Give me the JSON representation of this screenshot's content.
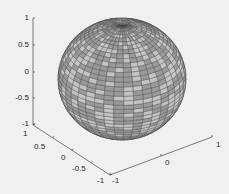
{
  "chart_data": {
    "type": "surface3d",
    "title": "",
    "xlabel": "",
    "ylabel": "",
    "zlabel": "",
    "xlim": [
      -1,
      1
    ],
    "ylim": [
      -1,
      1
    ],
    "zlim": [
      -1,
      1
    ],
    "xticks": [
      "-1",
      "0",
      "1"
    ],
    "yticks": [
      "-1",
      "-0.5",
      "0",
      "0.5",
      "1"
    ],
    "zticks": [
      "-1",
      "-0.5",
      "0",
      "0.5",
      "1"
    ],
    "grid": false,
    "legend": null,
    "surface": {
      "shape": "sphere",
      "radius": 1,
      "center": [
        0,
        0,
        0
      ],
      "mesh_rows": 40,
      "mesh_cols": 40,
      "face_colors": [
        "#9a9a9a",
        "#c4c4c4"
      ],
      "edge_color": "#3a3a3a"
    }
  },
  "axes": {
    "z_ticks": [
      {
        "label": "1",
        "y": 18
      },
      {
        "label": "0.5",
        "y": 45
      },
      {
        "label": "0",
        "y": 72
      },
      {
        "label": "-0.5",
        "y": 98
      },
      {
        "label": "-1",
        "y": 124
      }
    ],
    "y_ticks": [
      {
        "label": "1",
        "x": 25,
        "y": 133
      },
      {
        "label": "0.5",
        "x": 34,
        "y": 146
      },
      {
        "label": "0",
        "x": 61,
        "y": 157
      },
      {
        "label": "-0.5",
        "x": 72,
        "y": 168
      },
      {
        "label": "-1",
        "x": 97,
        "y": 180
      }
    ],
    "x_ticks": [
      {
        "label": "-1",
        "x": 112,
        "y": 180
      },
      {
        "label": "0",
        "x": 164,
        "y": 162
      },
      {
        "label": "1",
        "x": 216,
        "y": 144
      }
    ]
  }
}
